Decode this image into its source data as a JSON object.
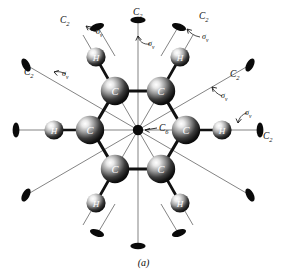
{
  "figure": {
    "caption": "(a)",
    "center_axis_label": "C6",
    "center_axis_label_main": "C",
    "center_axis_label_sub": "6",
    "atom_labels": {
      "carbon": "C",
      "hydrogen": "H"
    },
    "axis_label_main": "C",
    "axis_label_sub": "2",
    "mirror_label": "σ",
    "mirror_label_sub": "v",
    "colors": {
      "ink": "#0b0b0b",
      "background": "#ffffff",
      "bond": "#121212",
      "axis_line": "#6a6a6a",
      "sphere_dark": "#0d0d0d",
      "sphere_light": "#f2f2f2"
    },
    "geometry": {
      "center": [
        138,
        130
      ],
      "ring_radius": 45,
      "h_radius": 84,
      "tip_radius": 128
    },
    "annotations": [
      {
        "id": "c2-top",
        "c2": "C2",
        "sv": "σv",
        "angle_deg": 90,
        "show_c2": true,
        "show_sv": true
      },
      {
        "id": "c2-upper-left",
        "c2": "C2",
        "sv": "σv",
        "angle_deg": 120,
        "show_c2": true,
        "show_sv": true
      },
      {
        "id": "c2-upper-right",
        "c2": "C2",
        "sv": "σv",
        "angle_deg": 60,
        "show_c2": true,
        "show_sv": true
      },
      {
        "id": "c2-left-diag",
        "c2": "C2",
        "sv": "σv",
        "angle_deg": 150,
        "show_c2": true,
        "show_sv": true
      },
      {
        "id": "c2-right-diag",
        "c2": "C2",
        "sv": "σv",
        "angle_deg": 30,
        "show_c2": true,
        "show_sv": true
      },
      {
        "id": "c2-right",
        "c2": "C2",
        "sv": "σv",
        "angle_deg": 0,
        "show_c2": true,
        "show_sv": true
      },
      {
        "id": "c2-left",
        "c2": "",
        "sv": "",
        "angle_deg": 180,
        "show_c2": false,
        "show_sv": false
      },
      {
        "id": "c2-bottom",
        "c2": "",
        "sv": "",
        "angle_deg": 270,
        "show_c2": false,
        "show_sv": false
      },
      {
        "id": "c2-lower-left",
        "c2": "",
        "sv": "",
        "angle_deg": 210,
        "show_c2": false,
        "show_sv": false
      },
      {
        "id": "c2-lower-right",
        "c2": "",
        "sv": "",
        "angle_deg": 330,
        "show_c2": false,
        "show_sv": false
      },
      {
        "id": "c2-lower-left-b",
        "c2": "",
        "sv": "",
        "angle_deg": 240,
        "show_c2": false,
        "show_sv": false
      },
      {
        "id": "c2-lower-right-b",
        "c2": "",
        "sv": "",
        "angle_deg": 300,
        "show_c2": false,
        "show_sv": false
      }
    ],
    "labels": [
      {
        "name": "label-c2-top",
        "kind": "c2",
        "main": "C",
        "sub": "2",
        "x": 133,
        "y": 8
      },
      {
        "name": "label-sv-top",
        "kind": "sv",
        "main": "σ",
        "sub": "v",
        "x": 148,
        "y": 40
      },
      {
        "name": "label-c2-upper-left",
        "kind": "c2",
        "main": "C",
        "sub": "2",
        "x": 60,
        "y": 16
      },
      {
        "name": "label-sv-upper-left",
        "kind": "sv",
        "main": "σ",
        "sub": "v",
        "x": 96,
        "y": 28
      },
      {
        "name": "label-c2-upper-right",
        "kind": "c2",
        "main": "C",
        "sub": "2",
        "x": 199,
        "y": 12
      },
      {
        "name": "label-sv-upper-right",
        "kind": "sv",
        "main": "σ",
        "sub": "v",
        "x": 202,
        "y": 33
      },
      {
        "name": "label-c2-left-diag",
        "kind": "c2",
        "main": "C",
        "sub": "2",
        "x": 24,
        "y": 68
      },
      {
        "name": "label-sv-left-diag",
        "kind": "sv",
        "main": "σ",
        "sub": "v",
        "x": 62,
        "y": 70
      },
      {
        "name": "label-c2-right-diag",
        "kind": "c2",
        "main": "C",
        "sub": "2",
        "x": 230,
        "y": 70
      },
      {
        "name": "label-sv-right-diag",
        "kind": "sv",
        "main": "σ",
        "sub": "v",
        "x": 221,
        "y": 92
      },
      {
        "name": "label-sv-right",
        "kind": "sv",
        "main": "σ",
        "sub": "v",
        "x": 245,
        "y": 109
      },
      {
        "name": "label-c2-right",
        "kind": "c2",
        "main": "C",
        "sub": "2",
        "x": 263,
        "y": 132
      },
      {
        "name": "label-c6-center",
        "kind": "c6",
        "main": "C",
        "sub": "6",
        "x": 159,
        "y": 124
      }
    ]
  }
}
